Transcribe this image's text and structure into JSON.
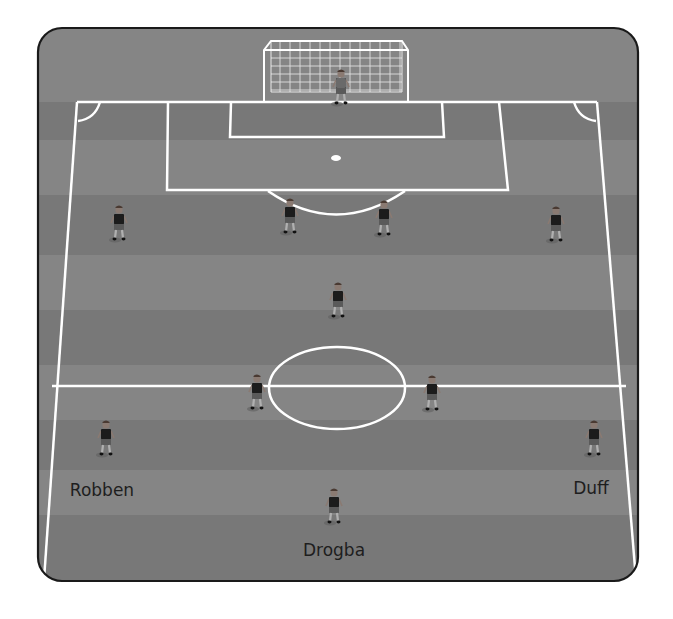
{
  "diagram": {
    "type": "football-formation",
    "colors": {
      "pitch": "#7f7f7f",
      "pitch_stripe_light": "#858585",
      "pitch_stripe_dark": "#787878",
      "lines": "#ffffff",
      "frame_border": "#1a1a1a",
      "player_shirt": "#1c1c1c",
      "player_shorts": "#5a5a5a",
      "goalkeeper_shirt": "#6a6a6a",
      "label_text": "#1e1e1e"
    },
    "goalkeeper": {
      "role": "goalkeeper"
    },
    "players": [
      {
        "role": "defender",
        "name": ""
      },
      {
        "role": "defender",
        "name": ""
      },
      {
        "role": "defender",
        "name": ""
      },
      {
        "role": "defender",
        "name": ""
      },
      {
        "role": "holding-midfielder",
        "name": ""
      },
      {
        "role": "midfielder",
        "name": ""
      },
      {
        "role": "midfielder",
        "name": ""
      },
      {
        "role": "winger-left",
        "name": "Robben"
      },
      {
        "role": "winger-right",
        "name": "Duff"
      },
      {
        "role": "striker",
        "name": "Drogba"
      }
    ],
    "labels": {
      "left_winger": "Robben",
      "right_winger": "Duff",
      "striker": "Drogba"
    }
  }
}
